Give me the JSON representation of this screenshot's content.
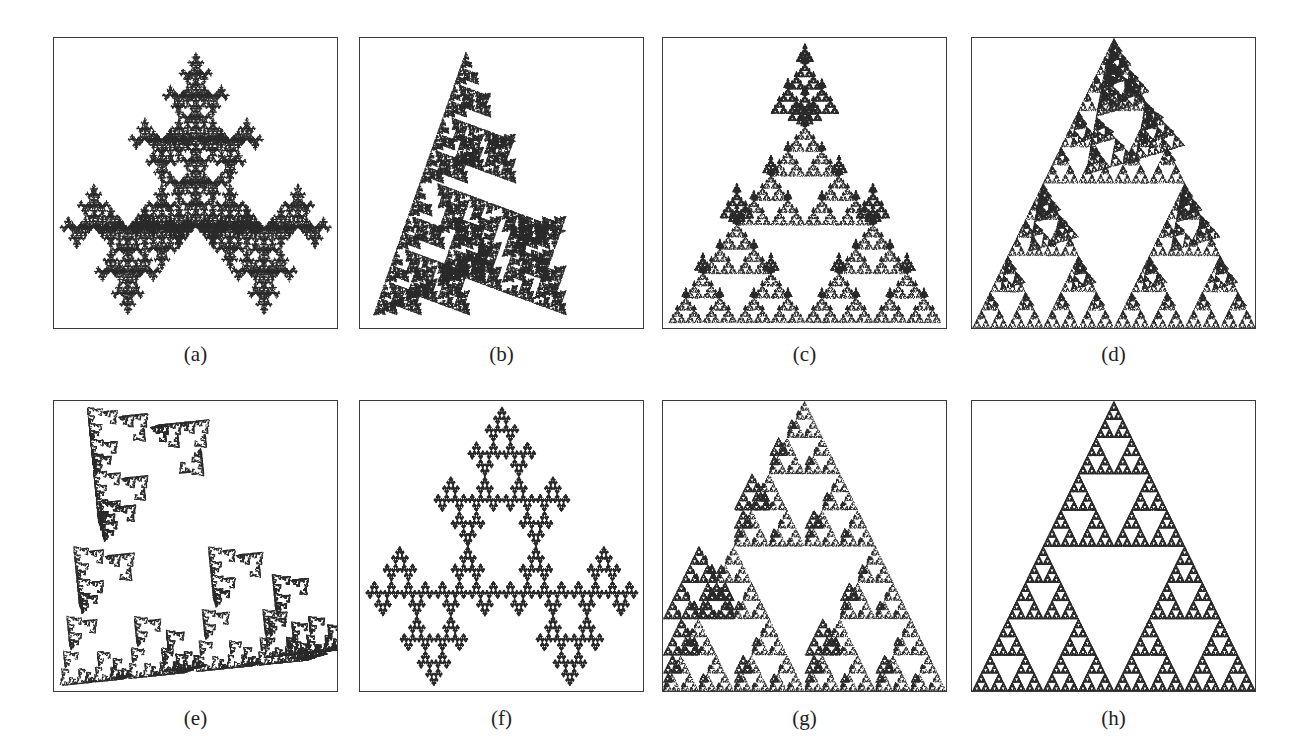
{
  "figure": {
    "ink_color": "#2b2b2b",
    "border_color": "#3a3a3a",
    "panels": [
      {
        "id": "a",
        "caption": "(a)",
        "kind": "sierpinski-tree",
        "maps": [
          [
            0.5,
            0,
            0,
            0.5,
            0.25,
            0.0
          ],
          [
            0.5,
            0,
            0,
            -0.5,
            0.0,
            1.0
          ],
          [
            0.5,
            0,
            0,
            -0.5,
            0.5,
            1.0
          ]
        ],
        "pattern": "a"
      },
      {
        "id": "b",
        "caption": "(b)",
        "kind": "rotated-cross-fractal",
        "pattern": "b"
      },
      {
        "id": "c",
        "caption": "(c)",
        "kind": "arrow-cross-fractal",
        "pattern": "c"
      },
      {
        "id": "d",
        "caption": "(d)",
        "kind": "sheared-triangle-fractal",
        "pattern": "d"
      },
      {
        "id": "e",
        "caption": "(e)",
        "kind": "clover-cross-fractal",
        "pattern": "e"
      },
      {
        "id": "f",
        "caption": "(f)",
        "kind": "triangle-tree-fractal",
        "pattern": "f"
      },
      {
        "id": "g",
        "caption": "(g)",
        "kind": "zigzag-triangle-fractal",
        "pattern": "g"
      },
      {
        "id": "h",
        "caption": "(h)",
        "kind": "inverted-sierpinski-fractal",
        "pattern": "h"
      }
    ]
  }
}
